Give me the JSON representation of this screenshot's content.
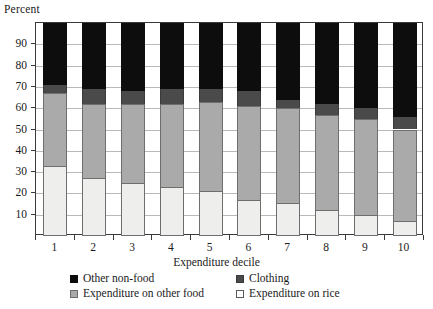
{
  "chart_data": {
    "type": "bar",
    "stacked": true,
    "title": "",
    "subtitle": "",
    "xlabel": "Expenditure decile",
    "ylabel": "Percent",
    "categories": [
      "1",
      "2",
      "3",
      "4",
      "5",
      "6",
      "7",
      "8",
      "9",
      "10"
    ],
    "ylim": [
      0,
      100
    ],
    "ytick_labels": [
      "10",
      "20",
      "30",
      "40",
      "50",
      "60",
      "70",
      "80",
      "90"
    ],
    "ytick_values": [
      10,
      20,
      30,
      40,
      50,
      60,
      70,
      80,
      90
    ],
    "grid": true,
    "legend_position": "bottom",
    "series": [
      {
        "name": "Expenditure on rice",
        "color": "#eeeeec",
        "values": [
          33,
          27,
          25,
          23,
          21,
          17,
          15.5,
          12,
          10,
          7
        ]
      },
      {
        "name": "Expenditure on other food",
        "color": "#aaaaaa",
        "values": [
          34,
          35,
          37,
          39,
          42,
          44,
          44.5,
          45,
          45,
          43
        ]
      },
      {
        "name": "Clothing",
        "color": "#4a4a4a",
        "values": [
          4,
          7,
          6,
          7,
          6,
          7,
          4,
          5,
          5,
          6
        ]
      },
      {
        "name": "Other non-food",
        "color": "#0d0d0d",
        "values": [
          29,
          31,
          32,
          31,
          31,
          32,
          36,
          38,
          40,
          44
        ]
      }
    ],
    "cumulative_tops": {
      "rice": [
        33,
        27,
        25,
        23,
        21,
        17,
        15.5,
        12,
        10,
        7
      ],
      "other_food": [
        67,
        62,
        62,
        62,
        63,
        61,
        60,
        57,
        55,
        50
      ],
      "clothing": [
        71,
        69,
        68,
        69,
        69,
        68,
        64,
        62,
        60,
        56
      ],
      "non_food": [
        100,
        100,
        100,
        100,
        100,
        100,
        100,
        100,
        100,
        100
      ]
    }
  },
  "axes": {
    "y_title": "Percent",
    "x_title": "Expenditure decile"
  },
  "legend": {
    "entries": [
      {
        "label": "Other non-food",
        "swatch": "black-square-icon"
      },
      {
        "label": "Clothing",
        "swatch": "dark-gray-square-icon"
      },
      {
        "label": "Expenditure on other food",
        "swatch": "light-gray-square-icon"
      },
      {
        "label": "Expenditure on rice",
        "swatch": "white-square-icon"
      }
    ]
  },
  "colors": {
    "non_food": "#0d0d0d",
    "clothing": "#4a4a4a",
    "other_food": "#aaaaaa",
    "rice": "#eeeeec",
    "axis": "#3a3a3a",
    "grid": "#b9b9b9"
  }
}
